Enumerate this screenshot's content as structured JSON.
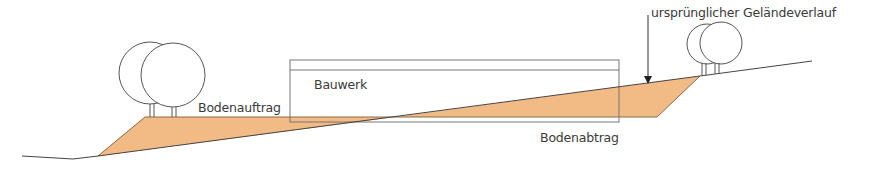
{
  "labels": {
    "fill": "Bodenauftrag",
    "building": "Bauwerk",
    "cut": "Bodenabtrag",
    "original_terrain": "ursprünglicher Geländeverlauf"
  },
  "colors": {
    "earth_fill": "#f2bb85",
    "line": "#444444",
    "tree_line": "#555555",
    "building_line": "#777777",
    "text": "#3a3a3a"
  }
}
